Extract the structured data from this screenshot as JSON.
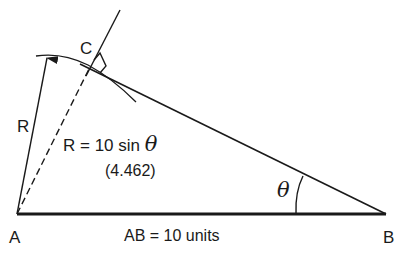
{
  "diagram": {
    "points": {
      "A": {
        "label": "A"
      },
      "B": {
        "label": "B"
      },
      "C": {
        "label": "C"
      }
    },
    "labels": {
      "radius": "R",
      "formula_prefix": "R = 10 sin ",
      "theta_symbol": "θ",
      "formula_value": "(4.462)",
      "angle": "θ",
      "base": "AB = 10 units"
    },
    "colors": {
      "line": "#1a1a1a",
      "background": "#ffffff"
    }
  }
}
